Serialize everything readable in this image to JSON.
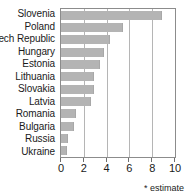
{
  "chart_data": {
    "type": "bar",
    "orientation": "horizontal",
    "title": "",
    "subtitle": "",
    "xlabel": "",
    "ylabel": "",
    "categories": [
      "Slovenia",
      "Poland",
      "ech Republic",
      "Hungary",
      "Estonia",
      "Lithuania",
      "Slovakia",
      "Latvia",
      "Romania",
      "Bulgaria",
      "Russia",
      "Ukraine"
    ],
    "values": [
      8.9,
      5.4,
      4.3,
      3.8,
      3.4,
      2.9,
      2.9,
      2.6,
      1.35,
      1.15,
      0.65,
      0.5
    ],
    "xlim": [
      0,
      10
    ],
    "xticks": [
      0,
      2,
      4,
      6,
      8,
      10
    ],
    "xtick_labels": [
      "0",
      "2",
      "4",
      "6",
      "8",
      "10"
    ],
    "grid": true,
    "grid_axis": "x",
    "legend": false,
    "annotations": [
      "* estimate"
    ],
    "bar_color": "#b4b4b4",
    "plot_border_color": "#8c8c8c",
    "gridline_color": "#b5b5b5",
    "text_color": "#1a1a1a"
  },
  "footnote": {
    "text": "* estimate"
  }
}
